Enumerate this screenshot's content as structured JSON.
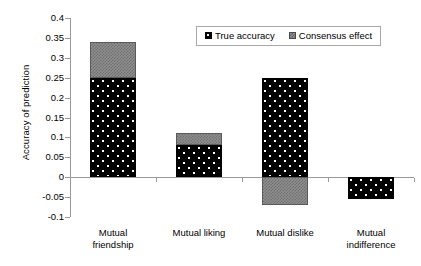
{
  "chart_data": {
    "type": "bar",
    "subtype": "stacked-bar-with-negative-values",
    "title": "",
    "xlabel": "",
    "ylabel": "Accuracy of prediction",
    "categories": [
      "Mutual\nfriendship",
      "Mutual liking",
      "Mutual dislike",
      "Mutual\nindifference"
    ],
    "category_labels_flat": [
      "Mutual friendship",
      "Mutual liking",
      "Mutual dislike",
      "Mutual indifference"
    ],
    "series": [
      {
        "name": "True accuracy",
        "values": [
          0.25,
          0.08,
          0.25,
          -0.055
        ],
        "color": "#000000",
        "pattern": "dotted-dark"
      },
      {
        "name": "Consensus effect",
        "values": [
          0.09,
          0.03,
          -0.07,
          0.0
        ],
        "color": "#8f8f8f",
        "pattern": "checkered-gray"
      }
    ],
    "stacked_tops": [
      0.34,
      0.11,
      0.25,
      -0.055
    ],
    "ylim": [
      -0.1,
      0.4
    ],
    "ytick_step": 0.05,
    "ytick_labels": [
      "0.4",
      "0.35",
      "0.3",
      "0.25",
      "0.2",
      "0.15",
      "0.1",
      "0.05",
      "0",
      "-0.05",
      "-0.1"
    ],
    "ytick_values": [
      0.4,
      0.35,
      0.3,
      0.25,
      0.2,
      0.15,
      0.1,
      0.05,
      0,
      -0.05,
      -0.1
    ],
    "grid": false,
    "legend_position": "top-center-inside",
    "legend_entries": [
      "True accuracy",
      "Consensus effect"
    ],
    "zero_line": true
  },
  "axes": {
    "y_title": "Accuracy of prediction"
  },
  "legend": {
    "items": [
      {
        "label": "True accuracy"
      },
      {
        "label": "Consensus effect"
      }
    ]
  }
}
